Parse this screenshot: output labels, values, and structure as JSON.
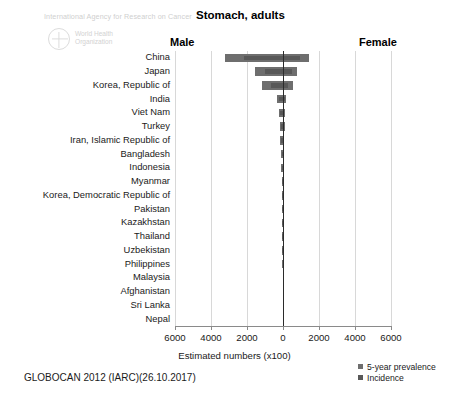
{
  "branding": {
    "iarc_text": "International Agency for Research on Cancer",
    "who_line1": "World Health",
    "who_line2": "Organization",
    "logo_icon": "who-emblem-icon"
  },
  "header": {
    "title": "Stomach, adults",
    "male_label": "Male",
    "female_label": "Female"
  },
  "footer": {
    "source": "GLOBOCAN 2012 (IARC)(26.10.2017)"
  },
  "colors": {
    "prevalence": "#6e6e6e",
    "incidence": "#585858",
    "gridline": "#d8d8d8",
    "axis": "#2b2b2b",
    "text": "#1a1a1a",
    "watermark": "#d2d2d2"
  },
  "legend": {
    "position": "bottom-right",
    "items": [
      {
        "label": "5-year prevalence",
        "color": "#6e6e6e"
      },
      {
        "label": "Incidence",
        "color": "#585858"
      }
    ]
  },
  "chart_data": {
    "type": "bar",
    "orientation": "horizontal-population-pyramid",
    "title": "Stomach, adults",
    "xlabel": "Estimated numbers (x100)",
    "ylabel": "",
    "xlim": [
      -6000,
      6000
    ],
    "xticks": [
      6000,
      4000,
      2000,
      0,
      2000,
      4000,
      6000
    ],
    "xtick_values": [
      -6000,
      -4000,
      -2000,
      0,
      2000,
      4000,
      6000
    ],
    "grid": true,
    "legend_position": "bottom-right",
    "left_side": "Male",
    "right_side": "Female",
    "categories": [
      "China",
      "Japan",
      "Korea, Republic of",
      "India",
      "Viet Nam",
      "Turkey",
      "Iran, Islamic Republic of",
      "Bangladesh",
      "Indonesia",
      "Myanmar",
      "Korea, Democratic Republic of",
      "Pakistan",
      "Kazakhstan",
      "Thailand",
      "Uzbekistan",
      "Philippines",
      "Malaysia",
      "Afghanistan",
      "Sri Lanka",
      "Nepal"
    ],
    "series": [
      {
        "name": "5-year prevalence",
        "color": "#6e6e6e",
        "male": [
          3220,
          1580,
          1180,
          330,
          210,
          175,
          145,
          110,
          95,
          80,
          72,
          62,
          55,
          48,
          42,
          38,
          26,
          22,
          16,
          12
        ],
        "female": [
          1430,
          760,
          560,
          190,
          105,
          95,
          78,
          62,
          58,
          45,
          40,
          38,
          34,
          30,
          26,
          24,
          16,
          14,
          10,
          8
        ]
      },
      {
        "name": "Incidence",
        "color": "#585858",
        "male": [
          2150,
          1010,
          640,
          215,
          140,
          110,
          92,
          74,
          62,
          54,
          48,
          42,
          36,
          32,
          28,
          25,
          17,
          15,
          11,
          8
        ],
        "female": [
          930,
          500,
          300,
          125,
          70,
          60,
          50,
          42,
          38,
          30,
          27,
          25,
          22,
          20,
          17,
          16,
          11,
          9,
          7,
          5
        ]
      }
    ]
  }
}
